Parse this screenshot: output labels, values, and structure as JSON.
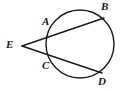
{
  "figure": {
    "background_color": "#ffffff",
    "stroke_color": "#1a1a1a",
    "label_color": "#1a1a1a",
    "stroke_width": 1.4
  },
  "circle": {
    "name": "circle",
    "center_x": 80,
    "center_y": 44,
    "radius": 34
  },
  "points": [
    {
      "id": "E",
      "label": "E",
      "x": 22,
      "y": 46,
      "label_x": 6,
      "label_y": 39,
      "role": "external-vertex"
    },
    {
      "id": "A",
      "label": "A",
      "x": 53,
      "y": 33,
      "label_x": 42,
      "label_y": 16,
      "role": "near-intersection-upper"
    },
    {
      "id": "B",
      "label": "B",
      "x": 101,
      "y": 19,
      "label_x": 101,
      "label_y": 1,
      "role": "far-intersection-upper"
    },
    {
      "id": "C",
      "label": "C",
      "x": 52,
      "y": 58,
      "label_x": 42,
      "label_y": 60,
      "role": "near-intersection-lower"
    },
    {
      "id": "D",
      "label": "D",
      "x": 99,
      "y": 72,
      "label_x": 98,
      "label_y": 76,
      "role": "far-intersection-lower"
    }
  ],
  "secants": [
    {
      "id": "EAB",
      "name": "secant-upper",
      "from": "E",
      "through": "A",
      "to": "B",
      "x1": 22,
      "y1": 46,
      "x2": 104,
      "y2": 18
    },
    {
      "id": "ECD",
      "name": "secant-lower",
      "from": "E",
      "through": "C",
      "to": "D",
      "x1": 22,
      "y1": 46,
      "x2": 102,
      "y2": 73
    }
  ],
  "chart_data": {
    "type": "diagram",
    "subtype": "euclidean-geometry",
    "labels": [
      "E",
      "A",
      "B",
      "C",
      "D"
    ]
  }
}
